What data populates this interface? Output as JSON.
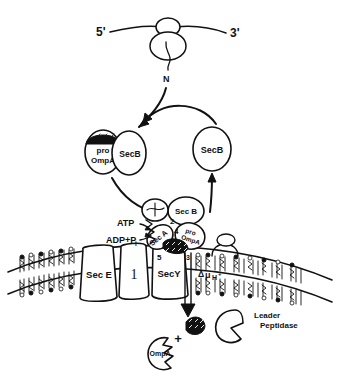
{
  "figure": {
    "ink_color": "#111111",
    "background_color": "#ffffff"
  },
  "ribosome": {
    "mrna_five_prime": "5'",
    "mrna_three_prime": "3'",
    "nascent_chain_label": "N"
  },
  "cytoplasm": {
    "complex": {
      "pro_ompa_line1": "pro",
      "pro_ompa_line2": "OmpA",
      "secb_label": "SecB"
    },
    "free_secb": {
      "label": "SecB"
    }
  },
  "translocase": {
    "secb_bound": "Sec B",
    "seca": "Sec A",
    "pro_ompa_line1": "pro",
    "pro_ompa_line2": "OmpA",
    "atp_label": "ATP",
    "adp_label": "ADP+P",
    "adp_subscript": "i",
    "steps": [
      "1",
      "2",
      "3",
      "4",
      "5"
    ]
  },
  "membrane": {
    "sec_e_label": "Sec E",
    "band_one_label": "1",
    "sec_y_label": "SecY",
    "pmf_delta": "Δ",
    "pmf_mu": "μ",
    "pmf_h": "H",
    "pmf_plus": "+"
  },
  "periplasm": {
    "leader_peptidase_line1": "Leader",
    "leader_peptidase_line2": "Peptidase",
    "plus_sign": "+",
    "mature_ompa_label": "OmpA"
  }
}
